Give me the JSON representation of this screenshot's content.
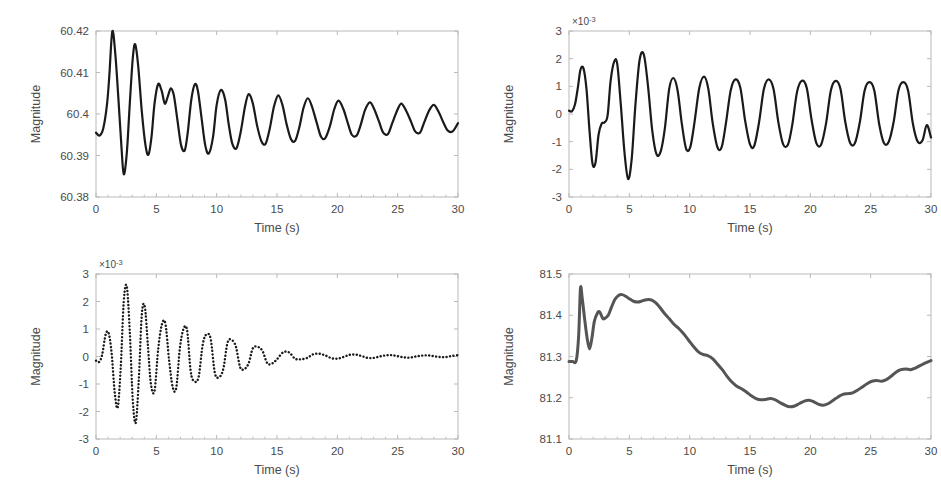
{
  "figure": {
    "background": "#ffffff",
    "axis_color": "#b9b9b9",
    "tick_text_color": "#4a4a4a",
    "subplot_count": 4,
    "layout": "2x2"
  },
  "chart_data": [
    {
      "id": "top-left",
      "type": "line",
      "title": "",
      "xlabel": "Time (s)",
      "ylabel": "Magnitude",
      "xlim": [
        0,
        30
      ],
      "ylim": [
        60.38,
        60.42
      ],
      "xticks": [
        0,
        5,
        10,
        15,
        20,
        25,
        30
      ],
      "xticklabels": [
        "0",
        "5",
        "10",
        "15",
        "20",
        "25",
        "30"
      ],
      "yticks": [
        60.38,
        60.39,
        60.4,
        60.41,
        60.42
      ],
      "yticklabels": [
        "60.38",
        "60.39",
        "60.4",
        "60.41",
        "60.42"
      ],
      "exponent_label": "",
      "grid": false,
      "legend": "none",
      "line_style": "solid",
      "line_color": "#1a1a1a",
      "line_width": 2.2,
      "description": "Damped oscillation of system frequency settling toward 60.4 Hz",
      "series": [
        {
          "name": "frequency",
          "x": [
            0,
            0.3,
            0.6,
            0.9,
            1.1,
            1.35,
            1.6,
            1.85,
            2.1,
            2.3,
            2.55,
            2.8,
            3.05,
            3.25,
            3.5,
            3.8,
            4.1,
            4.35,
            4.6,
            4.85,
            5.15,
            5.45,
            5.7,
            5.95,
            6.2,
            6.45,
            6.75,
            7.05,
            7.35,
            7.6,
            7.9,
            8.2,
            8.45,
            8.75,
            9.05,
            9.35,
            9.7,
            10.0,
            10.35,
            10.7,
            11.0,
            11.3,
            11.65,
            12.0,
            12.35,
            12.65,
            13.0,
            13.35,
            13.7,
            14.05,
            14.4,
            14.75,
            15.1,
            15.45,
            15.8,
            16.15,
            16.5,
            16.85,
            17.2,
            17.55,
            17.9,
            18.3,
            18.65,
            19.0,
            19.4,
            19.75,
            20.1,
            20.5,
            20.85,
            21.2,
            21.6,
            21.95,
            22.3,
            22.7,
            23.05,
            23.45,
            23.8,
            24.2,
            24.55,
            24.95,
            25.3,
            25.7,
            26.1,
            26.45,
            26.85,
            27.2,
            27.6,
            28.0,
            28.4,
            28.75,
            29.15,
            29.55,
            30.0
          ],
          "y": [
            60.3955,
            60.3948,
            60.3965,
            60.402,
            60.409,
            60.4199,
            60.4145,
            60.404,
            60.3925,
            60.3855,
            60.3905,
            60.4025,
            60.4135,
            60.4168,
            60.4115,
            60.4005,
            60.3925,
            60.3902,
            60.3945,
            60.4025,
            60.4072,
            60.4055,
            60.4025,
            60.4042,
            60.4062,
            60.4045,
            60.3985,
            60.3925,
            60.3912,
            60.3955,
            60.4035,
            60.4072,
            60.4055,
            60.399,
            60.3925,
            60.3905,
            60.3945,
            60.4022,
            60.4058,
            60.4035,
            60.3975,
            60.3928,
            60.3918,
            60.3958,
            60.4018,
            60.4048,
            60.4025,
            60.3972,
            60.3935,
            60.3928,
            60.3965,
            60.4018,
            60.4045,
            60.4022,
            60.3975,
            60.394,
            60.3935,
            60.3968,
            60.4015,
            60.4038,
            60.4018,
            60.3978,
            60.3945,
            60.3942,
            60.3972,
            60.4012,
            60.4032,
            60.4012,
            60.398,
            60.395,
            60.3948,
            60.3975,
            60.401,
            60.4028,
            60.4012,
            60.3982,
            60.3955,
            60.3952,
            60.3978,
            60.4008,
            60.4025,
            60.4008,
            60.3982,
            60.3958,
            60.3955,
            60.398,
            60.4008,
            60.4022,
            60.4005,
            60.3982,
            60.396,
            60.3958,
            60.3978
          ]
        }
      ]
    },
    {
      "id": "top-right",
      "type": "line",
      "title": "",
      "xlabel": "Time (s)",
      "ylabel": "Magnitude",
      "xlim": [
        0,
        30
      ],
      "ylim": [
        -3,
        3
      ],
      "xticks": [
        0,
        5,
        10,
        15,
        20,
        25,
        30
      ],
      "xticklabels": [
        "0",
        "5",
        "10",
        "15",
        "20",
        "25",
        "30"
      ],
      "yticks": [
        -3,
        -2,
        -1,
        0,
        1,
        2,
        3
      ],
      "yticklabels": [
        "-3",
        "-2",
        "-1",
        "0",
        "1",
        "2",
        "3"
      ],
      "exponent_label": "×10",
      "exponent_power": "-3",
      "grid": false,
      "legend": "none",
      "line_style": "solid",
      "line_color": "#1a1a1a",
      "line_width": 2.2,
      "description": "Sustained inter-area oscillation, amplitude about 1e-3, slowly decaying",
      "series": [
        {
          "name": "mode",
          "x": [
            0,
            0.25,
            0.5,
            0.75,
            0.95,
            1.2,
            1.45,
            1.7,
            1.95,
            2.2,
            2.45,
            2.7,
            2.95,
            3.2,
            3.45,
            3.75,
            4.0,
            4.3,
            4.6,
            4.9,
            5.2,
            5.5,
            5.85,
            6.2,
            6.55,
            6.9,
            7.25,
            7.6,
            7.95,
            8.3,
            8.65,
            9.0,
            9.35,
            9.7,
            10.05,
            10.4,
            10.8,
            11.2,
            11.55,
            11.9,
            12.3,
            12.65,
            13.0,
            13.4,
            13.8,
            14.2,
            14.6,
            15.0,
            15.35,
            15.75,
            16.15,
            16.55,
            16.95,
            17.35,
            17.75,
            18.15,
            18.5,
            18.9,
            19.3,
            19.7,
            20.1,
            20.5,
            20.9,
            21.3,
            21.7,
            22.1,
            22.5,
            22.9,
            23.3,
            23.7,
            24.1,
            24.5,
            24.9,
            25.3,
            25.7,
            26.1,
            26.5,
            26.9,
            27.3,
            27.7,
            28.1,
            28.5,
            28.9,
            29.3,
            29.65,
            30.0
          ],
          "y": [
            0.12,
            0.1,
            0.35,
            1.0,
            1.6,
            1.65,
            0.9,
            -0.6,
            -1.8,
            -1.75,
            -0.75,
            -0.35,
            -0.3,
            -0.05,
            1.2,
            1.9,
            1.8,
            0.3,
            -1.4,
            -2.35,
            -1.6,
            0.3,
            1.95,
            2.15,
            1.0,
            -0.6,
            -1.45,
            -1.35,
            -0.5,
            0.9,
            1.3,
            0.85,
            -0.35,
            -1.25,
            -1.2,
            -0.3,
            0.95,
            1.35,
            0.9,
            -0.3,
            -1.2,
            -1.2,
            -0.35,
            0.85,
            1.25,
            0.95,
            -0.25,
            -1.1,
            -1.15,
            -0.3,
            0.9,
            1.25,
            0.9,
            -0.3,
            -1.1,
            -1.1,
            -0.4,
            0.8,
            1.2,
            0.95,
            -0.2,
            -1.05,
            -1.1,
            -0.35,
            0.85,
            1.2,
            0.9,
            -0.3,
            -1.05,
            -1.05,
            -0.3,
            0.85,
            1.15,
            0.85,
            -0.35,
            -1.05,
            -1.0,
            -0.3,
            0.85,
            1.15,
            0.85,
            -0.35,
            -1.0,
            -0.95,
            -0.4,
            -0.85
          ]
        }
      ]
    },
    {
      "id": "bottom-left",
      "type": "line",
      "title": "",
      "xlabel": "Time (s)",
      "ylabel": "Magnitude",
      "xlim": [
        0,
        30
      ],
      "ylim": [
        -3,
        3
      ],
      "xticks": [
        0,
        5,
        10,
        15,
        20,
        25,
        30
      ],
      "xticklabels": [
        "0",
        "5",
        "10",
        "15",
        "20",
        "25",
        "30"
      ],
      "yticks": [
        -3,
        -2,
        -1,
        0,
        1,
        2,
        3
      ],
      "yticklabels": [
        "-3",
        "-2",
        "-1",
        "0",
        "1",
        "2",
        "3"
      ],
      "exponent_label": "×10",
      "exponent_power": "-3",
      "grid": false,
      "legend": "none",
      "line_style": "dotted",
      "line_color": "#1a1a1a",
      "line_width": 2.0,
      "description": "Well-damped oscillatory mode decaying to zero by about 15 s, dotted trace",
      "series": [
        {
          "name": "mode",
          "x": [
            0,
            0.25,
            0.5,
            0.8,
            1.05,
            1.3,
            1.55,
            1.8,
            2.05,
            2.3,
            2.55,
            2.8,
            3.05,
            3.3,
            3.55,
            3.8,
            4.05,
            4.3,
            4.55,
            4.85,
            5.15,
            5.45,
            5.75,
            6.05,
            6.35,
            6.65,
            6.95,
            7.25,
            7.55,
            7.85,
            8.15,
            8.5,
            8.85,
            9.15,
            9.5,
            9.85,
            10.2,
            10.55,
            10.9,
            11.25,
            11.6,
            11.95,
            12.3,
            12.65,
            13.0,
            13.4,
            13.8,
            14.2,
            14.6,
            15.0,
            15.5,
            16.0,
            16.5,
            17.0,
            17.5,
            18.0,
            18.5,
            19.0,
            19.5,
            20.0,
            20.5,
            21.0,
            21.5,
            22.0,
            22.5,
            23.0,
            23.5,
            24.0,
            24.5,
            25.0,
            25.5,
            26.0,
            26.5,
            27.0,
            27.5,
            28.0,
            28.5,
            29.0,
            29.5,
            30.0
          ],
          "y": [
            -0.15,
            -0.2,
            0.05,
            0.8,
            0.85,
            0.1,
            -1.3,
            -1.85,
            -0.4,
            2.0,
            2.55,
            0.9,
            -1.6,
            -2.4,
            -0.8,
            1.55,
            1.8,
            0.4,
            -1.0,
            -1.25,
            0.25,
            1.15,
            1.2,
            -0.1,
            -1.1,
            -1.15,
            0.3,
            1.0,
            0.95,
            -0.55,
            -0.9,
            -0.75,
            0.45,
            0.8,
            0.65,
            -0.6,
            -0.75,
            -0.45,
            0.5,
            0.6,
            0.35,
            -0.4,
            -0.45,
            -0.25,
            0.3,
            0.35,
            0.2,
            -0.25,
            -0.25,
            -0.1,
            0.15,
            0.15,
            -0.08,
            -0.1,
            -0.05,
            0.08,
            0.1,
            0.04,
            -0.06,
            -0.08,
            -0.02,
            0.06,
            0.07,
            0.02,
            -0.05,
            -0.05,
            0.0,
            0.04,
            0.05,
            0.01,
            -0.03,
            -0.04,
            0.0,
            0.03,
            0.04,
            0.01,
            -0.02,
            -0.02,
            0.02,
            0.05
          ]
        }
      ]
    },
    {
      "id": "bottom-right",
      "type": "line",
      "title": "",
      "xlabel": "Time (s)",
      "ylabel": "Magnitude",
      "xlim": [
        0,
        30
      ],
      "ylim": [
        81.1,
        81.5
      ],
      "xticks": [
        0,
        5,
        10,
        15,
        20,
        25,
        30
      ],
      "xticklabels": [
        "0",
        "5",
        "10",
        "15",
        "20",
        "25",
        "30"
      ],
      "yticks": [
        81.1,
        81.2,
        81.3,
        81.4,
        81.5
      ],
      "yticklabels": [
        "81.1",
        "81.2",
        "81.3",
        "81.4",
        "81.5"
      ],
      "exponent_label": "",
      "grid": false,
      "legend": "none",
      "line_style": "solid",
      "line_color": "#555555",
      "line_width": 3.0,
      "description": "Slow voltage-angle-like excursion rising to 81.45 then dipping to 81.18 and recovering",
      "series": [
        {
          "name": "magnitude",
          "x": [
            0,
            0.3,
            0.6,
            0.8,
            0.95,
            1.1,
            1.3,
            1.5,
            1.7,
            1.9,
            2.1,
            2.35,
            2.55,
            2.8,
            3.0,
            3.25,
            3.5,
            3.8,
            4.1,
            4.4,
            4.7,
            5.0,
            5.35,
            5.7,
            6.0,
            6.3,
            6.6,
            6.9,
            7.2,
            7.5,
            7.9,
            8.3,
            8.7,
            9.1,
            9.5,
            9.9,
            10.3,
            10.7,
            11.1,
            11.5,
            11.9,
            12.3,
            12.7,
            13.1,
            13.5,
            13.9,
            14.3,
            14.7,
            15.1,
            15.5,
            15.9,
            16.3,
            16.7,
            17.1,
            17.5,
            17.9,
            18.3,
            18.7,
            19.1,
            19.5,
            19.9,
            20.3,
            20.7,
            21.1,
            21.5,
            21.9,
            22.3,
            22.7,
            23.1,
            23.5,
            23.9,
            24.3,
            24.7,
            25.1,
            25.5,
            25.9,
            26.3,
            26.7,
            27.1,
            27.5,
            27.9,
            28.3,
            28.7,
            29.1,
            29.5,
            30.0
          ],
          "y": [
            81.288,
            81.288,
            81.29,
            81.35,
            81.465,
            81.44,
            81.39,
            81.345,
            81.318,
            81.345,
            81.385,
            81.405,
            81.408,
            81.392,
            81.393,
            81.4,
            81.418,
            81.438,
            81.448,
            81.45,
            81.446,
            81.44,
            81.434,
            81.432,
            81.434,
            81.437,
            81.438,
            81.436,
            81.43,
            81.42,
            81.405,
            81.392,
            81.378,
            81.368,
            81.355,
            81.34,
            81.325,
            81.312,
            81.305,
            81.302,
            81.295,
            81.282,
            81.268,
            81.252,
            81.238,
            81.228,
            81.222,
            81.214,
            81.205,
            81.198,
            81.195,
            81.196,
            81.198,
            81.195,
            81.188,
            81.182,
            81.178,
            81.18,
            81.186,
            81.192,
            81.194,
            81.19,
            81.184,
            81.182,
            81.186,
            81.194,
            81.202,
            81.208,
            81.21,
            81.212,
            81.218,
            81.226,
            81.234,
            81.24,
            81.242,
            81.24,
            81.244,
            81.252,
            81.262,
            81.268,
            81.27,
            81.268,
            81.272,
            81.278,
            81.284,
            81.29
          ]
        }
      ]
    }
  ]
}
